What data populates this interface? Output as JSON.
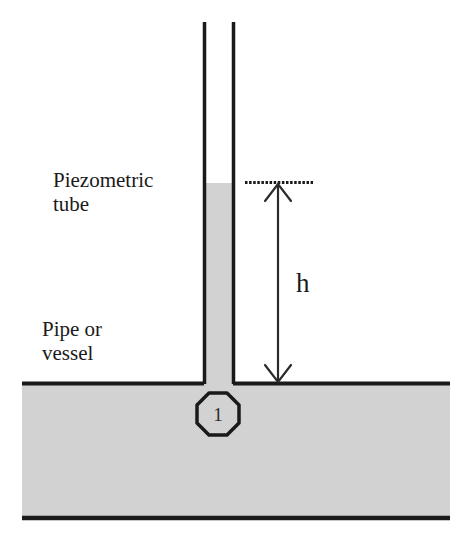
{
  "figure": {
    "labels": {
      "piezometric_line1": "Piezometric",
      "piezometric_line2": "tube",
      "vessel_line1": "Pipe or",
      "vessel_line2": "vessel",
      "height_symbol": "h",
      "point_marker": "1"
    },
    "colors": {
      "fluid_fill": "#d2d2d2",
      "outline": "#1a1a1a",
      "background": "#ffffff",
      "text": "#1a1a1a"
    },
    "geometry": {
      "tube_left_x": 203,
      "tube_right_x": 234,
      "tube_top_y": 22,
      "fluid_level_y": 183,
      "pipe_top_y": 383,
      "pipe_bottom_y": 518,
      "pipe_left_x": 22,
      "pipe_right_x": 450,
      "dimension_x": 278,
      "reference_line_x1": 245,
      "reference_line_x2": 313,
      "node_center_x": 218,
      "node_center_y": 414,
      "node_radius": 22
    }
  }
}
